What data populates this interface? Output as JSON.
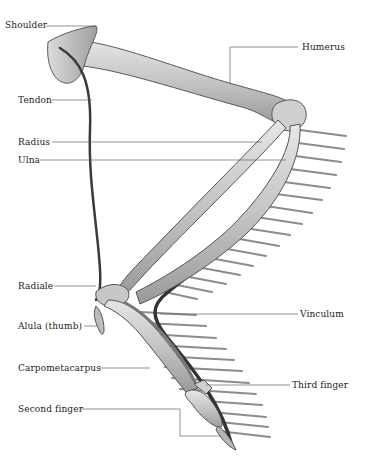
{
  "diagram": {
    "labels_left": [
      {
        "id": "shoulder",
        "text": "Shoulder",
        "x": 5,
        "y": 22
      },
      {
        "id": "tendon",
        "text": "Tendon",
        "x": 18,
        "y": 96
      },
      {
        "id": "radius",
        "text": "Radius",
        "x": 18,
        "y": 138
      },
      {
        "id": "ulna",
        "text": "Ulna",
        "x": 18,
        "y": 156
      },
      {
        "id": "radiale",
        "text": "Radiale",
        "x": 18,
        "y": 282
      },
      {
        "id": "alula",
        "text": "Alula (thumb)",
        "x": 18,
        "y": 322
      },
      {
        "id": "carpometacarpus",
        "text": "Carpometacarpus",
        "x": 18,
        "y": 364
      },
      {
        "id": "second-finger",
        "text": "Second finger",
        "x": 18,
        "y": 405
      }
    ],
    "labels_right": [
      {
        "id": "humerus",
        "text": "Humerus",
        "x": 302,
        "y": 43
      },
      {
        "id": "vinculum",
        "text": "Vinculum",
        "x": 300,
        "y": 310
      },
      {
        "id": "third-finger",
        "text": "Third finger",
        "x": 292,
        "y": 381
      }
    ],
    "colors": {
      "bone_fill": "#c9c9c9",
      "bone_stroke": "#555555",
      "tendon": "#3a3a3a",
      "quill": "#8a8a8a",
      "leader_line": "#666666",
      "text": "#1c1c1c"
    }
  }
}
